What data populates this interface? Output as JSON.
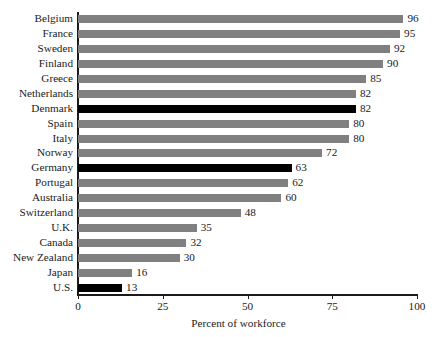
{
  "chart_data": {
    "type": "bar",
    "orientation": "horizontal",
    "title": "",
    "subtitle": "",
    "xlabel": "Percent of workforce",
    "ylabel": "",
    "xlim": [
      0,
      100
    ],
    "xticks": [
      0,
      25,
      50,
      75,
      100
    ],
    "xtick_labels": [
      "0",
      "25",
      "50",
      "75",
      "100"
    ],
    "grid": false,
    "legend": null,
    "categories": [
      "Belgium",
      "France",
      "Sweden",
      "Finland",
      "Greece",
      "Netherlands",
      "Denmark",
      "Spain",
      "Italy",
      "Norway",
      "Germany",
      "Portugal",
      "Australia",
      "Switzerland",
      "U.K.",
      "Canada",
      "New Zealand",
      "Japan",
      "U.S."
    ],
    "values": [
      96,
      95,
      92,
      90,
      85,
      82,
      82,
      80,
      80,
      72,
      63,
      62,
      60,
      48,
      35,
      32,
      30,
      16,
      13
    ],
    "value_labels": [
      "96",
      "95",
      "92",
      "90",
      "85",
      "82",
      "82",
      "80",
      "80",
      "72",
      "63",
      "62",
      "60",
      "48",
      "35",
      "32",
      "30",
      "16",
      "13"
    ],
    "bar_colors": [
      "#808080",
      "#808080",
      "#808080",
      "#808080",
      "#808080",
      "#808080",
      "#000000",
      "#808080",
      "#808080",
      "#808080",
      "#000000",
      "#808080",
      "#808080",
      "#808080",
      "#808080",
      "#808080",
      "#808080",
      "#808080",
      "#000000"
    ],
    "highlight_color": "#000000",
    "default_color": "#808080",
    "axis_color": "#1a1a1a",
    "background_color": "#ffffff"
  }
}
